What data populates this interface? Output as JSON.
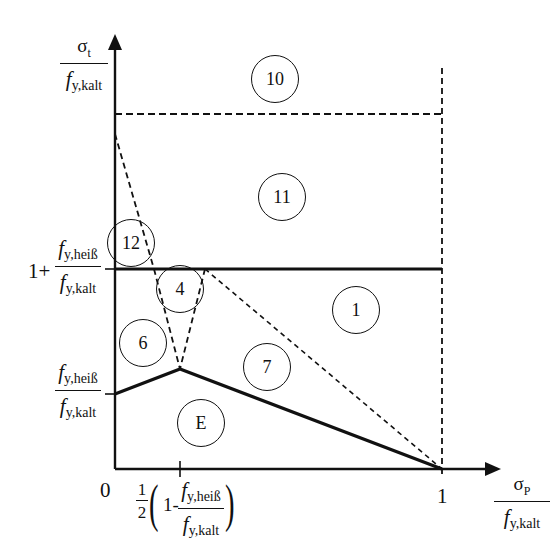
{
  "axes": {
    "y_label": {
      "numerator": "σ",
      "numerator_sub": "t",
      "denominator_f": "f",
      "denominator_sub": "y,kalt"
    },
    "x_label": {
      "numerator": "σ",
      "numerator_sub": "P",
      "denominator_f": "f",
      "denominator_sub": "y,kalt"
    },
    "origin_tick": "0",
    "x_tick_one": "1",
    "x_tick_mid": {
      "half_num": "1",
      "half_den": "2",
      "one_minus": "1-",
      "f": "f",
      "num_sub": "y,heiß",
      "den_sub": "y,kalt"
    },
    "y_tick_upper": {
      "prefix": "1+",
      "f": "f",
      "num_sub": "y,heiß",
      "den_sub": "y,kalt"
    },
    "y_tick_lower": {
      "f": "f",
      "num_sub": "y,heiß",
      "den_sub": "y,kalt"
    }
  },
  "regions": [
    {
      "id": "10",
      "label": "10"
    },
    {
      "id": "11",
      "label": "11"
    },
    {
      "id": "12",
      "label": "12"
    },
    {
      "id": "4",
      "label": "4"
    },
    {
      "id": "1",
      "label": "1"
    },
    {
      "id": "6",
      "label": "6"
    },
    {
      "id": "7",
      "label": "7"
    },
    {
      "id": "E",
      "label": "E"
    }
  ],
  "style": {
    "line_color": "#111111",
    "background": "#ffffff"
  }
}
